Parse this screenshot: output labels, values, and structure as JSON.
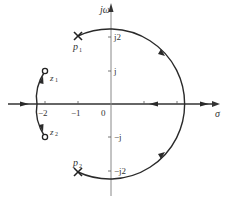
{
  "diagram": {
    "type": "root-locus",
    "axes": {
      "real_label": "σ",
      "imag_label": "jω",
      "origin_label": "0",
      "real_ticks": [
        "−2",
        "−1"
      ],
      "imag_ticks": [
        "j2",
        "j",
        "−j",
        "−j2"
      ]
    },
    "poles": [
      {
        "label": "p",
        "sub": "1",
        "re": -1,
        "im": 2
      },
      {
        "label": "p",
        "sub": "2",
        "re": -1,
        "im": -2
      }
    ],
    "zeros": [
      {
        "label": "z",
        "sub": "1",
        "re": -2,
        "im": 1
      },
      {
        "label": "z",
        "sub": "2",
        "re": -2,
        "im": -1
      }
    ],
    "colors": {
      "line": "#2a2a2a",
      "axis": "#555555",
      "text": "#333333"
    }
  }
}
